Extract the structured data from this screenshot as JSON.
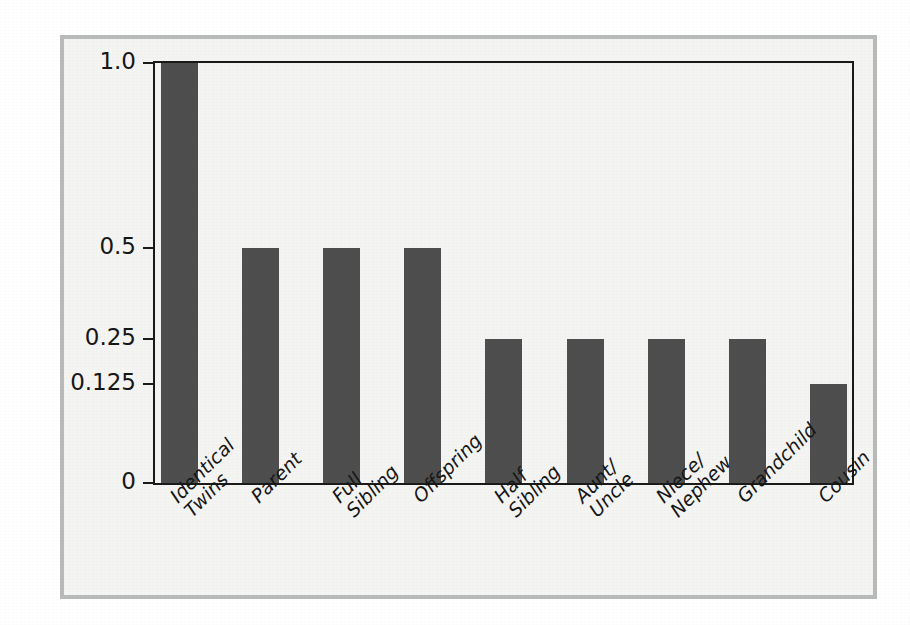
{
  "chart_data": {
    "type": "bar",
    "title": "",
    "subtitle": "",
    "xlabel": "",
    "ylabel": "",
    "categories": [
      "Identical Twins",
      "Parent",
      "Full Sibling",
      "Offspring",
      "Half Sibling",
      "Aunt/ Uncle",
      "Niece/ Nephew",
      "Grandchild",
      "Cousin"
    ],
    "category_lines": [
      [
        "Identical",
        "Twins"
      ],
      [
        "Parent"
      ],
      [
        "Full",
        "Sibling"
      ],
      [
        "Offspring"
      ],
      [
        "Half",
        "Sibling"
      ],
      [
        "Aunt/",
        "Uncle"
      ],
      [
        "Niece/",
        "Nephew"
      ],
      [
        "Grandchild"
      ],
      [
        "Cousin"
      ]
    ],
    "values": [
      1.0,
      0.5,
      0.5,
      0.5,
      0.25,
      0.25,
      0.25,
      0.25,
      0.125
    ],
    "value_labels": [
      "1.0",
      "0.5",
      "0.5",
      "0.5",
      "0.25",
      "0.25",
      "0.25",
      "0.25",
      "0.125"
    ],
    "ytick_labels": [
      "1.0",
      "0.5",
      "0.25",
      "0.125",
      "0"
    ],
    "ytick_values": [
      1.0,
      0.5,
      0.25,
      0.125,
      0
    ],
    "ytick_fractions": [
      1.0,
      0.5602,
      0.3435,
      0.2364,
      0.0
    ],
    "ylim": [
      0,
      1.0
    ],
    "grid": false,
    "legend": null,
    "scale_note": "non-linear (log-like) y axis",
    "colors": {
      "bar": "#4e4e4e",
      "axis": "#1a1a1a",
      "plot_background": "#f4f4f3",
      "outer_frame": "#b9bbbb",
      "page_background": "#ffffff",
      "text": "#161616"
    }
  }
}
